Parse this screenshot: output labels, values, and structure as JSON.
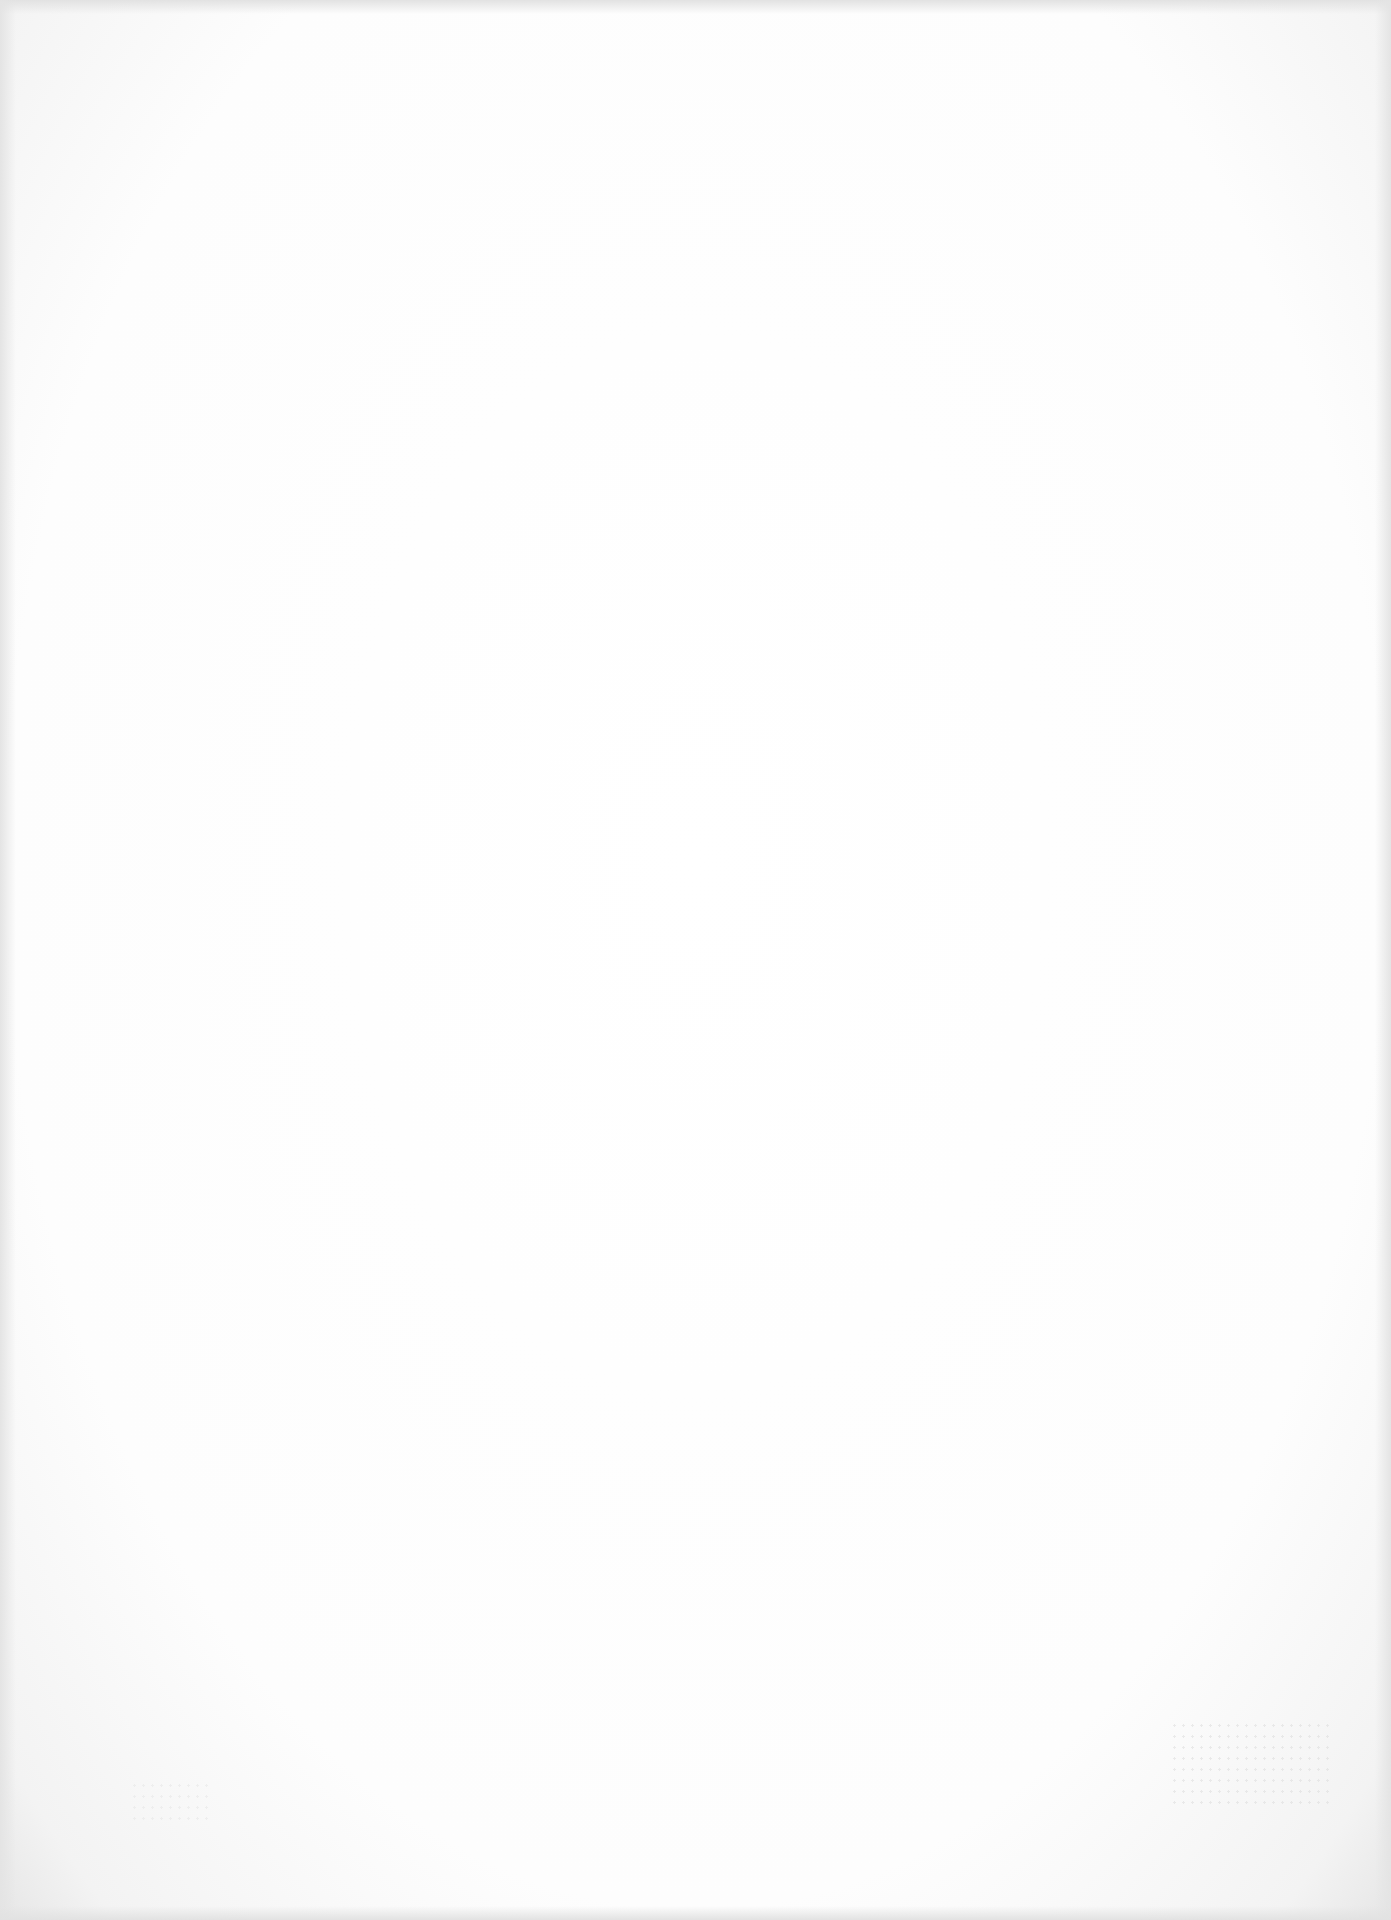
{
  "document": {
    "type": "blank scanned page",
    "background_color": "#ffffff",
    "visible_text": [],
    "artifacts": {
      "top_bleed_through": "",
      "bottom_right_speckle": true,
      "bottom_left_speckle": true
    }
  }
}
